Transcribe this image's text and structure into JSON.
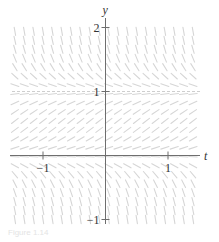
{
  "figure": {
    "type": "slope-field",
    "axes": {
      "x_label": "t",
      "y_label": "y",
      "x_ticks": [
        {
          "value": -1,
          "label": "−1"
        },
        {
          "value": 1,
          "label": "1"
        }
      ],
      "y_ticks": [
        {
          "value": 2,
          "label": "2"
        },
        {
          "value": 1,
          "label": "1"
        },
        {
          "value": -1,
          "label": "−1"
        }
      ],
      "x_range": [
        -1.5,
        1.5
      ],
      "y_range": [
        -1.1,
        2.1
      ]
    },
    "equilibrium_lines": [
      1
    ],
    "field": {
      "autonomous": true,
      "description": "slopes negative above y=1, positive between 0 and 1, negative below 0; steepening away from equilibria",
      "t_min": -1.45,
      "t_max": 1.45,
      "t_step": 0.15,
      "y_min": -1.0,
      "y_max": 2.0,
      "y_step": 0.14,
      "gain": 3.0
    },
    "colors": {
      "axis": "#6e6e6e",
      "slope_mark": "#d6d6d6",
      "equilibrium": "#c8c8c8",
      "text": "#333333"
    },
    "caption": "Figure 1.14"
  }
}
